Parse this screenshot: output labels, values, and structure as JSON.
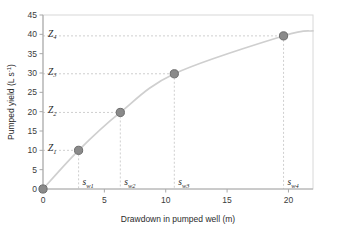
{
  "chart_data": {
    "type": "scatter",
    "title": "",
    "xlabel": "Drawdown in pumped well (m)",
    "ylabel": "Pumped yield (L s⁻¹)",
    "xlim": [
      0,
      22
    ],
    "ylim": [
      0,
      45
    ],
    "xticks": [
      "0",
      "5",
      "10",
      "15",
      "20"
    ],
    "xtick_values": [
      0,
      5,
      10,
      15,
      20
    ],
    "yticks": [
      "0",
      "5",
      "10",
      "15",
      "20",
      "25",
      "30",
      "35",
      "40",
      "45"
    ],
    "ytick_values": [
      0,
      5,
      10,
      15,
      20,
      25,
      30,
      35,
      40,
      45
    ],
    "grid": false,
    "legend": "none",
    "x": [
      0,
      2.9,
      6.3,
      10.7,
      19.6
    ],
    "y": [
      0,
      10.0,
      19.8,
      29.8,
      39.6
    ],
    "series": [
      {
        "name": "Step-drawdown test",
        "x": [
          0,
          2.9,
          6.3,
          10.7,
          19.6
        ],
        "values": [
          0,
          10.0,
          19.8,
          29.8,
          39.6
        ]
      }
    ],
    "point_labels_x": [
      "",
      "s_w1",
      "s_w2",
      "s_w3",
      "s_w4"
    ],
    "point_labels_y": [
      "",
      "Z_1",
      "Z_2",
      "Z_3",
      "Z_4"
    ],
    "curve_color": "#cfcfcf",
    "marker_color": "#8a8a8a",
    "marker_edge_color": "#6b6b6b",
    "leader_color": "#c8c8c8",
    "frame_color": "#d6d6d6",
    "axis_color": "#a8a8a8"
  },
  "annotations": {
    "y_axis_labels": [
      {
        "base": "Z",
        "sub": "1",
        "value": 10.0
      },
      {
        "base": "Z",
        "sub": "2",
        "value": 19.8
      },
      {
        "base": "Z",
        "sub": "3",
        "value": 29.8
      },
      {
        "base": "Z",
        "sub": "4",
        "value": 39.6
      }
    ],
    "x_axis_labels": [
      {
        "base": "s",
        "sub": "w1",
        "value": 2.9
      },
      {
        "base": "s",
        "sub": "w2",
        "value": 6.3
      },
      {
        "base": "s",
        "sub": "w3",
        "value": 10.7
      },
      {
        "base": "s",
        "sub": "w4",
        "value": 19.6
      }
    ]
  },
  "axis": {
    "xlabel": "Drawdown in pumped well (m)",
    "ylabel_main": "Pumped yield (L s",
    "ylabel_sup": "-1",
    "ylabel_close": ")"
  },
  "xtick_labels": {
    "t0": "0",
    "t1": "5",
    "t2": "10",
    "t3": "15",
    "t4": "20"
  },
  "ytick_labels": {
    "t0": "0",
    "t1": "5",
    "t2": "10",
    "t3": "15",
    "t4": "20",
    "t5": "25",
    "t6": "30",
    "t7": "35",
    "t8": "40",
    "t9": "45"
  },
  "zlabels": {
    "z1_base": "Z",
    "z1_sub": "1",
    "z2_base": "Z",
    "z2_sub": "2",
    "z3_base": "Z",
    "z3_sub": "3",
    "z4_base": "Z",
    "z4_sub": "4"
  },
  "swlabels": {
    "s1_base": "s",
    "s1_sub": "w1",
    "s2_base": "s",
    "s2_sub": "w2",
    "s3_base": "s",
    "s3_sub": "w3",
    "s4_base": "s",
    "s4_sub": "w4"
  }
}
